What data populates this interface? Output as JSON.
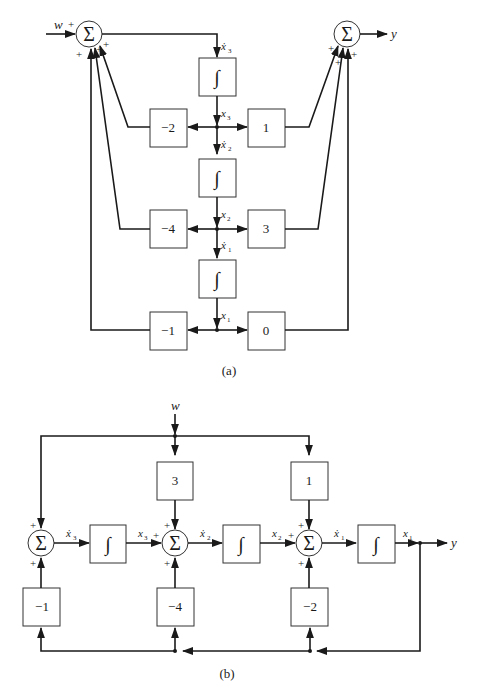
{
  "diagram_a": {
    "caption": "(a)",
    "input_label": "w",
    "output_label": "y",
    "sum_symbol": "Σ",
    "integral_symbol": "∫",
    "plus_sign": "+",
    "signals": {
      "x3_dot": "ẋ",
      "x3": "x",
      "x2_dot": "ẋ",
      "x2": "x",
      "x1_dot": "ẋ",
      "x1": "x",
      "sub3": "3",
      "sub2": "2",
      "sub1": "1"
    },
    "feedback_gains": [
      "−2",
      "−4",
      "−1"
    ],
    "output_gains": [
      "1",
      "3",
      "0"
    ]
  },
  "diagram_b": {
    "caption": "(b)",
    "input_label": "w",
    "output_label": "y",
    "sum_symbol": "Σ",
    "integral_symbol": "∫",
    "plus_sign": "+",
    "feedforward_gains": [
      "3",
      "1"
    ],
    "feedback_gains": [
      "−1",
      "−4",
      "−2"
    ],
    "signals": {
      "dot": "ẋ",
      "x": "x",
      "sub3": "3",
      "sub2": "2",
      "sub1": "1"
    }
  }
}
